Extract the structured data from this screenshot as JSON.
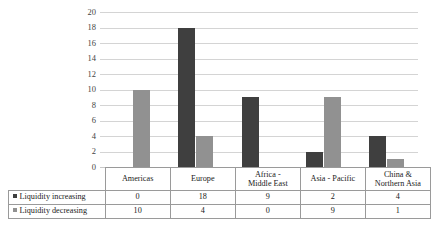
{
  "chart_data": {
    "type": "bar",
    "title": "",
    "xlabel": "",
    "ylabel": "",
    "ylim": [
      0,
      20
    ],
    "ytick_step": 2,
    "yticks": [
      20,
      18,
      16,
      14,
      12,
      10,
      8,
      6,
      4,
      2,
      0
    ],
    "grid": true,
    "legend_position": "table-left",
    "categories": [
      "Americas",
      "Europe",
      "Africa - Middle East",
      "Asia - Pacific",
      "China & Northern Asia"
    ],
    "series": [
      {
        "name": "Liquidity increasing",
        "color": "#3f3f3f",
        "values": [
          0,
          18,
          9,
          2,
          4
        ]
      },
      {
        "name": "Liquidity decreasing",
        "color": "#919191",
        "values": [
          10,
          4,
          0,
          9,
          1
        ]
      }
    ]
  },
  "table": {
    "category_labels": [
      [
        "Americas"
      ],
      [
        "Europe"
      ],
      [
        "Africa -",
        "Middle East"
      ],
      [
        "Asia - Pacific"
      ],
      [
        "China &",
        "Northern Asia"
      ]
    ],
    "rows": [
      {
        "label": "Liquidity increasing",
        "swatch": "square-dark",
        "values": [
          "0",
          "18",
          "9",
          "2",
          "4"
        ]
      },
      {
        "label": "Liquidity decreasing",
        "swatch": "square-gray",
        "values": [
          "10",
          "4",
          "0",
          "9",
          "1"
        ]
      }
    ]
  },
  "yticks_text": [
    "20",
    "18",
    "16",
    "14",
    "12",
    "10",
    "8",
    "6",
    "4",
    "2",
    "0"
  ]
}
